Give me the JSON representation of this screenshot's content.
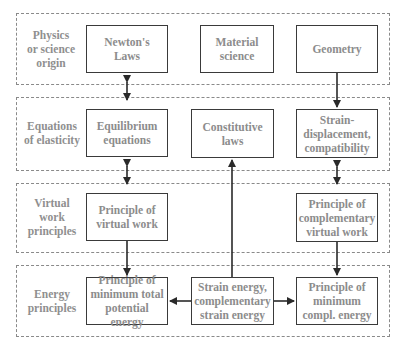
{
  "rows": [
    {
      "label": "Physics\nor science\norigin"
    },
    {
      "label": "Equations\nof elasticity"
    },
    {
      "label": "Virtual\nwork\nprinciples"
    },
    {
      "label": "Energy\nprinciples"
    }
  ],
  "boxes": {
    "newtons_laws": "Newton's\nLaws",
    "material_science": "Material\nscience",
    "geometry": "Geometry",
    "equilibrium_equations": "Equilibrium\nequations",
    "constitutive_laws": "Constitutive\nlaws",
    "strain_displacement": "Strain-\ndisplacement,\ncompatibility",
    "principle_virtual_work": "Principle of\nvirtual work",
    "principle_complementary_virtual_work": "Principle of\ncomplementary\nvirtual work",
    "principle_min_total_potential_energy": "Principle of\nminimum total\npotential energy",
    "strain_energy": "Strain energy,\ncomplementary\nstrain energy",
    "principle_min_compl_energy": "Principle of\nminimum\ncompl. energy"
  },
  "colors": {
    "text": "#8c8c8c",
    "box_border": "#3a3a3a",
    "panel_border": "#8a8a8a",
    "arrow": "#2a2a2a"
  }
}
